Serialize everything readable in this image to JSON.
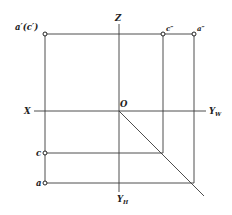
{
  "diagram": {
    "type": "orthographic-projection",
    "axes": {
      "X": "X",
      "Z": "Z",
      "origin": "O",
      "YW": {
        "base": "Y",
        "sub": "W"
      },
      "YH": {
        "base": "Y",
        "sub": "H"
      }
    },
    "points": {
      "front_view": "a′(c′)",
      "side_view_c": "c″",
      "side_view_a": "a″",
      "top_view_c": "c",
      "top_view_a": "a"
    }
  }
}
